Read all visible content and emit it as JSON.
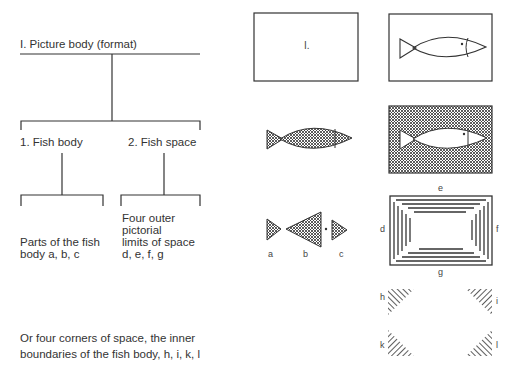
{
  "tree": {
    "root": "I. Picture body (format)",
    "branch1": "1. Fish body",
    "branch2": "2. Fish space",
    "leaf1": [
      "Parts of the fish",
      "body a, b, c"
    ],
    "leaf2": [
      "Four outer",
      "pictorial",
      "limits of space",
      "d, e, f, g"
    ],
    "footer": [
      "Or four corners of space, the inner",
      "boundaries of the fish body, h, i, k, l"
    ]
  },
  "figures": {
    "format_label": "I.",
    "parts_labels": [
      "a",
      "b",
      "c"
    ],
    "frame_labels": {
      "top": "e",
      "left": "d",
      "right": "f",
      "bottom": "g"
    },
    "corner_labels": {
      "top_left": "h",
      "top_right": "i",
      "bottom_left": "k",
      "bottom_right": "l"
    }
  },
  "colors": {
    "ink": "#2a2a2a",
    "background": "#ffffff"
  }
}
